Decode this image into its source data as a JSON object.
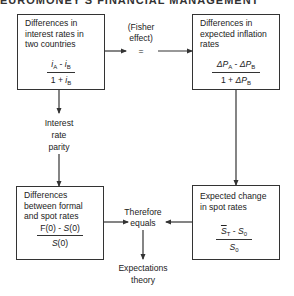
{
  "header": {
    "text": "EUROMONEY'S FINANCIAL MANAGEMENT"
  },
  "boxes": {
    "interest_rates": {
      "title": [
        "Differences in",
        "interest rates in",
        "two countries"
      ],
      "numerator": {
        "a": "i",
        "a_sub": "A",
        "op": " - ",
        "b": "i",
        "b_sub": "B"
      },
      "denominator": {
        "lead": "1 + ",
        "b": "i",
        "b_sub": "B"
      }
    },
    "inflation_rates": {
      "title": [
        "Differences in",
        "expected inflation",
        "rates"
      ],
      "numerator": {
        "a": "ΔP",
        "a_sub": "A",
        "op": " - ",
        "b": "ΔP",
        "b_sub": "B"
      },
      "denominator": {
        "lead": "1 + ",
        "b": "ΔP",
        "b_sub": "B"
      }
    },
    "forward_spot": {
      "title": [
        "Differences",
        "between formal",
        "and spot rates"
      ],
      "numerator": {
        "a": "F(0) - ",
        "b": "S",
        "b_tail": "(0)"
      },
      "denominator": {
        "b": "S",
        "b_tail": "(0)"
      }
    },
    "spot_change": {
      "title": [
        "Expected change",
        "in spot rates"
      ],
      "numerator": {
        "a": "S",
        "a_sub": "T",
        "op": " - ",
        "b": "S",
        "b_sub": "0"
      },
      "denominator": {
        "b": "S",
        "b_sub": "0"
      }
    }
  },
  "labels": {
    "fisher_line1": "(Fisher",
    "fisher_line2": "effect)",
    "equals_sign": "=",
    "irp_line1": "Interest",
    "irp_line2": "rate",
    "irp_line3": "parity",
    "therefore_line1": "Therefore",
    "therefore_line2": "equals",
    "expect_line1": "Expectations",
    "expect_line2": "theory"
  },
  "colors": {
    "line": "#333333",
    "text": "#222222",
    "background": "#ffffff"
  }
}
